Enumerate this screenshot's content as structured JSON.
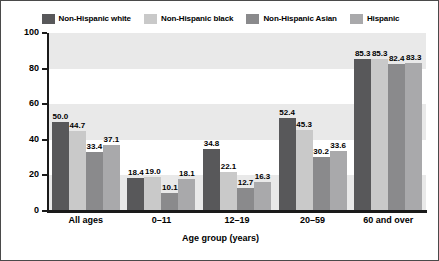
{
  "chart_data": {
    "type": "bar",
    "title": "",
    "xlabel": "Age group (years)",
    "ylabel": "Percent",
    "ylim": [
      0,
      100
    ],
    "yticks": [
      0,
      20,
      40,
      60,
      80,
      100
    ],
    "grid": false,
    "legend_position": "top",
    "categories": [
      "All ages",
      "0–11",
      "12–19",
      "20–59",
      "60 and over"
    ],
    "series": [
      {
        "name": "Non-Hispanic white",
        "color": "#58585a",
        "values": [
          50.0,
          18.4,
          34.8,
          52.4,
          85.3
        ],
        "labels": [
          "50.0",
          "18.4",
          "34.8",
          "52.4",
          "85.3"
        ]
      },
      {
        "name": "Non-Hispanic black",
        "color": "#c9c9c9",
        "values": [
          44.7,
          19.0,
          22.1,
          45.3,
          85.3
        ],
        "labels": [
          "44.7",
          "19.0",
          "22.1",
          "45.3",
          "85.3"
        ]
      },
      {
        "name": "Non-Hispanic Asian",
        "color": "#8a8a8c",
        "values": [
          33.4,
          10.1,
          12.7,
          30.2,
          82.4
        ],
        "labels": [
          "33.4",
          "10.1",
          "12.7",
          "30.2",
          "82.4"
        ]
      },
      {
        "name": "Hispanic",
        "color": "#a9a9ab",
        "values": [
          37.1,
          18.1,
          16.3,
          33.6,
          83.3
        ],
        "labels": [
          "37.1",
          "18.1",
          "16.3",
          "33.6",
          "83.3"
        ]
      }
    ],
    "band_color": "#e9e9e9",
    "axis_color": "#1a1a1a",
    "background": "#ffffff",
    "bands": [
      [
        0,
        20
      ],
      [
        40,
        60
      ],
      [
        80,
        100
      ]
    ]
  }
}
